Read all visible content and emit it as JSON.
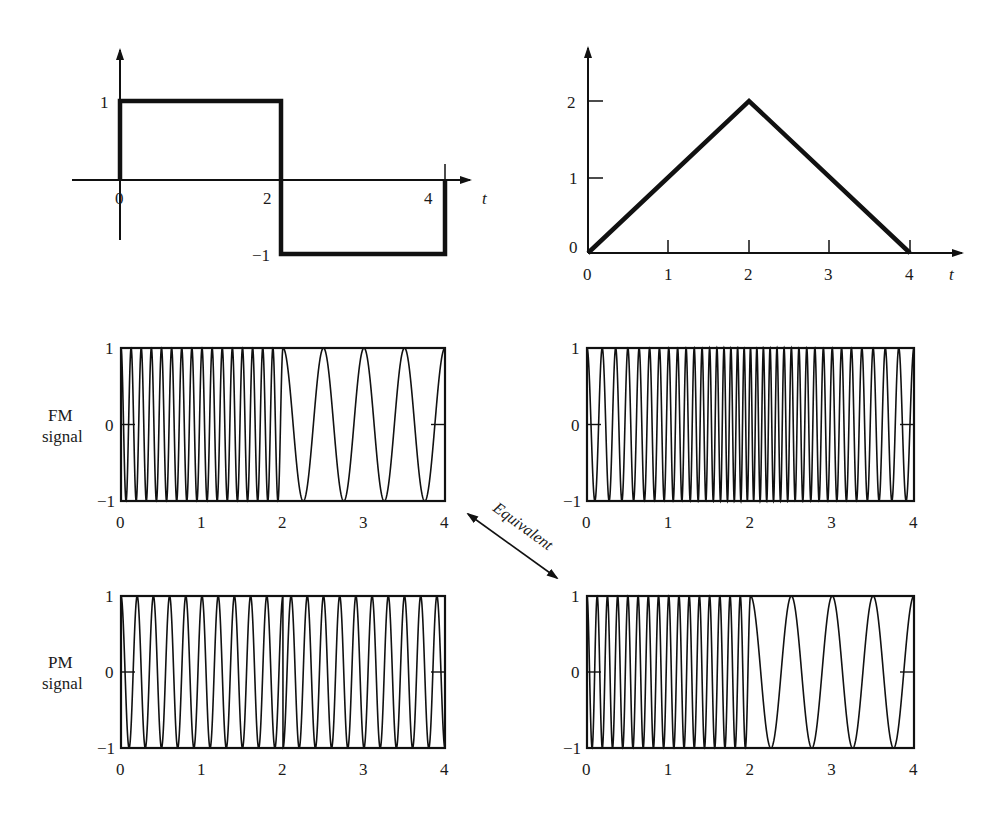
{
  "chart_data": [
    {
      "id": "message-left",
      "type": "line",
      "title": "",
      "xlabel": "t",
      "ylabel": "",
      "x_ticks": [
        "0",
        "2",
        "4"
      ],
      "y_ticks": [
        "1",
        "-1"
      ],
      "description": "Square-wave message signal",
      "x": [
        0,
        0,
        2,
        2,
        4,
        4
      ],
      "y": [
        0,
        1,
        1,
        -1,
        -1,
        0
      ],
      "xlim": [
        -0.6,
        4.4
      ],
      "ylim": [
        -1,
        1
      ]
    },
    {
      "id": "message-right",
      "type": "line",
      "title": "",
      "xlabel": "t",
      "ylabel": "",
      "x_ticks": [
        "0",
        "1",
        "2",
        "3",
        "4"
      ],
      "y_ticks": [
        "0",
        "1",
        "2"
      ],
      "description": "Triangular message signal (integral of the square wave)",
      "x": [
        0,
        2,
        4
      ],
      "y": [
        0,
        2,
        0
      ],
      "xlim": [
        0,
        4.6
      ],
      "ylim": [
        0,
        2.5
      ]
    },
    {
      "id": "fm-left",
      "type": "line",
      "ylabel": "FM signal",
      "x_ticks": [
        "0",
        "1",
        "2",
        "3",
        "4"
      ],
      "y_ticks": [
        "1",
        "0",
        "-1"
      ],
      "description": "FM of square wave: high frequency (~8 cycles/unit) for 0<t<2, low frequency (~2 cycles/unit) for 2<t<4",
      "segments": [
        {
          "t_start": 0,
          "t_end": 2,
          "cycles_per_unit": 8
        },
        {
          "t_start": 2,
          "t_end": 4,
          "cycles_per_unit": 2
        }
      ],
      "xlim": [
        0,
        4
      ],
      "ylim": [
        -1,
        1
      ]
    },
    {
      "id": "fm-right",
      "type": "line",
      "x_ticks": [
        "0",
        "1",
        "2",
        "3",
        "4"
      ],
      "y_ticks": [
        "1",
        "0",
        "-1"
      ],
      "description": "FM of triangular wave: frequency increases linearly to a maximum at t=2 then decreases",
      "instantaneous_freq": {
        "t": [
          0,
          2,
          4
        ],
        "cycles_per_unit": [
          5,
          13,
          5
        ]
      },
      "xlim": [
        0,
        4
      ],
      "ylim": [
        -1,
        1
      ]
    },
    {
      "id": "pm-left",
      "type": "line",
      "ylabel": "PM signal",
      "x_ticks": [
        "0",
        "1",
        "2",
        "3",
        "4"
      ],
      "y_ticks": [
        "1",
        "0",
        "-1"
      ],
      "description": "PM of square wave: constant frequency (~5 cycles/unit) with a phase jump at t=2",
      "segments": [
        {
          "t_start": 0,
          "t_end": 2,
          "cycles_per_unit": 5,
          "phase": 0
        },
        {
          "t_start": 2,
          "t_end": 4,
          "cycles_per_unit": 5,
          "phase": 3.14159
        }
      ],
      "xlim": [
        0,
        4
      ],
      "ylim": [
        -1,
        1
      ]
    },
    {
      "id": "pm-right",
      "type": "line",
      "x_ticks": [
        "0",
        "1",
        "2",
        "3",
        "4"
      ],
      "y_ticks": [
        "1",
        "0",
        "-1"
      ],
      "description": "PM of triangular wave: identical to FM of square wave (~8 cycles/unit then ~2 cycles/unit)",
      "segments": [
        {
          "t_start": 0,
          "t_end": 2,
          "cycles_per_unit": 8
        },
        {
          "t_start": 2,
          "t_end": 4,
          "cycles_per_unit": 2
        }
      ],
      "xlim": [
        0,
        4
      ],
      "ylim": [
        -1,
        1
      ]
    }
  ],
  "labels": {
    "t_axis": "t",
    "fm_row_line1": "FM",
    "fm_row_line2": "signal",
    "pm_row_line1": "PM",
    "pm_row_line2": "signal",
    "equivalent": "Equivalent"
  },
  "ticks": {
    "sq_x": [
      "0",
      "2",
      "4"
    ],
    "sq_y_pos": "1",
    "sq_y_neg": "−1",
    "tri_x": [
      "0",
      "1",
      "2",
      "3",
      "4"
    ],
    "tri_y": [
      "0",
      "1",
      "2"
    ],
    "box_x": [
      "0",
      "1",
      "2",
      "3",
      "4"
    ],
    "box_y": [
      "1",
      "0",
      "−1"
    ]
  }
}
